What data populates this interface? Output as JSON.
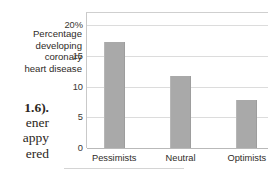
{
  "body_text": {
    "fragments": [
      {
        "text": "1.6).",
        "bold": true
      },
      {
        "text": "ener",
        "bold": false
      },
      {
        "text": "appy",
        "bold": false
      },
      {
        "text": "ered",
        "bold": false
      }
    ]
  },
  "axis_caption": {
    "lines": [
      "Percentage",
      "developing",
      "coronary",
      "heart disease"
    ]
  },
  "chart_data": {
    "type": "bar",
    "title": "",
    "subtitle": "",
    "xlabel": "",
    "ylabel": "Percentage developing coronary heart disease",
    "categories": [
      "Pessimists",
      "Neutral",
      "Optimists"
    ],
    "values": [
      17.2,
      11.8,
      7.8
    ],
    "ylim": [
      0,
      22
    ],
    "yticks": [
      0,
      5,
      10,
      15,
      20
    ],
    "ytick_labels": [
      "0",
      "5",
      "10",
      "15",
      "20%"
    ],
    "grid": true,
    "legend": "none",
    "bar_color": "#a9a9a9",
    "gridline_color": "#dcdcdc",
    "axis_color": "#b9b9b9"
  }
}
